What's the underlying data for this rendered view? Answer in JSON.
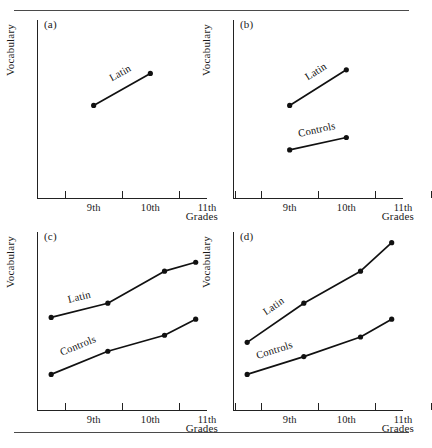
{
  "figure": {
    "panel_letters": [
      "(a)",
      "(b)",
      "(c)",
      "(d)"
    ],
    "axis_y_title": "Vocabulary",
    "axis_x_title": "Grades",
    "x_tick_labels": [
      "9th",
      "10th",
      "11th"
    ],
    "series_names": {
      "latin": "Latin",
      "controls": "Controls"
    },
    "line_color": "#111111",
    "rule_color": "#4a4a4a"
  },
  "chart_data": [
    {
      "type": "line",
      "panel": "(a)",
      "title": "(a)",
      "xlabel": "Grades",
      "ylabel": "Vocabulary",
      "categories": [
        "9th",
        "10th",
        "11th"
      ],
      "x": [
        9.5,
        10.5
      ],
      "xlim": [
        8.5,
        11.5
      ],
      "ylim": [
        0,
        100
      ],
      "grid": false,
      "legend": "inline-labels",
      "series": [
        {
          "name": "Latin",
          "x": [
            9.5,
            10.5
          ],
          "values": [
            52,
            70
          ]
        }
      ]
    },
    {
      "type": "line",
      "panel": "(b)",
      "title": "(b)",
      "xlabel": "Grades",
      "ylabel": "Vocabulary",
      "categories": [
        "9th",
        "10th",
        "11th"
      ],
      "x": [
        9.5,
        10.5
      ],
      "xlim": [
        8.5,
        11.5
      ],
      "ylim": [
        0,
        100
      ],
      "grid": false,
      "legend": "inline-labels",
      "series": [
        {
          "name": "Latin",
          "x": [
            9.5,
            10.5
          ],
          "values": [
            52,
            72
          ]
        },
        {
          "name": "Controls",
          "x": [
            9.5,
            10.5
          ],
          "values": [
            27,
            34
          ]
        }
      ]
    },
    {
      "type": "line",
      "panel": "(c)",
      "title": "(c)",
      "xlabel": "Grades",
      "ylabel": "Vocabulary",
      "categories": [
        "9th",
        "10th",
        "11th"
      ],
      "x": [
        8.75,
        9.75,
        10.75,
        11.3
      ],
      "xlim": [
        8.5,
        11.5
      ],
      "ylim": [
        0,
        100
      ],
      "grid": false,
      "legend": "inline-labels",
      "series": [
        {
          "name": "Latin",
          "x": [
            8.75,
            9.75,
            10.75,
            11.3
          ],
          "values": [
            52,
            60,
            78,
            83
          ]
        },
        {
          "name": "Controls",
          "x": [
            8.75,
            9.75,
            10.75,
            11.3
          ],
          "values": [
            20,
            33,
            42,
            51
          ]
        }
      ]
    },
    {
      "type": "line",
      "panel": "(d)",
      "title": "(d)",
      "xlabel": "Grades",
      "ylabel": "Vocabulary",
      "categories": [
        "9th",
        "10th",
        "11th"
      ],
      "x": [
        8.75,
        9.75,
        10.75,
        11.3
      ],
      "xlim": [
        8.5,
        11.5
      ],
      "ylim": [
        0,
        100
      ],
      "grid": false,
      "legend": "inline-labels",
      "series": [
        {
          "name": "Latin",
          "x": [
            8.75,
            9.75,
            10.75,
            11.3
          ],
          "values": [
            38,
            60,
            78,
            94
          ]
        },
        {
          "name": "Controls",
          "x": [
            8.75,
            9.75,
            10.75,
            11.3
          ],
          "values": [
            20,
            30,
            41,
            51
          ]
        }
      ]
    }
  ]
}
